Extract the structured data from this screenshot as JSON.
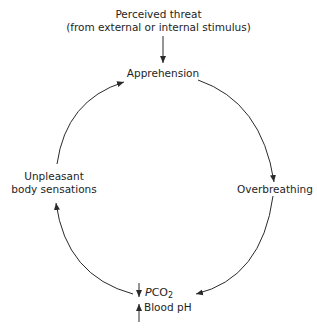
{
  "diagram": {
    "title_node": {
      "line1": "Perceived threat",
      "line2": "(from external or internal stimulus)"
    },
    "nodes": {
      "apprehension": "Apprehension",
      "overbreathing": "Overbreathing",
      "unpleasant_line1": "Unpleasant",
      "unpleasant_line2": "body sensations",
      "pco2_prefix": "P",
      "pco2_main": "CO",
      "pco2_sub": "2",
      "blood_ph": "Blood pH"
    },
    "indicators": {
      "pco2_direction": "down",
      "blood_ph_direction": "up"
    },
    "edges": [
      {
        "from": "Perceived threat",
        "to": "Apprehension"
      },
      {
        "from": "Apprehension",
        "to": "Overbreathing"
      },
      {
        "from": "Overbreathing",
        "to": "PCO2 down / Blood pH up"
      },
      {
        "from": "PCO2 down / Blood pH up",
        "to": "Unpleasant body sensations"
      },
      {
        "from": "Unpleasant body sensations",
        "to": "Apprehension"
      }
    ],
    "colors": {
      "stroke": "#2a2a2a",
      "text": "#1e1e1e",
      "background": "#ffffff"
    }
  }
}
